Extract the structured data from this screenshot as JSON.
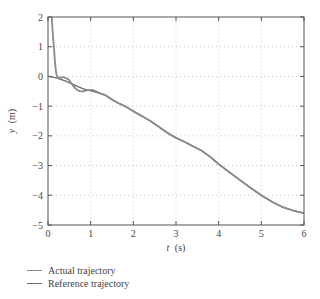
{
  "chart_data": {
    "type": "line",
    "title": "",
    "xlabel": "t (s)",
    "xlabel_var": "t",
    "xlabel_unit": "(s)",
    "ylabel": "y (m)",
    "ylabel_var": "y",
    "ylabel_unit": "(m)",
    "xlim": [
      0,
      6
    ],
    "ylim": [
      -5,
      2
    ],
    "xticks": [
      0,
      1,
      2,
      3,
      4,
      5,
      6
    ],
    "yticks": [
      2,
      1,
      0,
      -1,
      -2,
      -3,
      -4,
      -5
    ],
    "xtick_labels": [
      "0",
      "1",
      "2",
      "3",
      "4",
      "5",
      "6"
    ],
    "ytick_labels": [
      "2",
      "1",
      "0",
      "−1",
      "−2",
      "−3",
      "−4",
      "−5"
    ],
    "grid": true,
    "grid_style": "dotted",
    "legend_position": "below",
    "series": [
      {
        "name": "Actual trajectory",
        "color": "#8a8a8a",
        "x": [
          0.09,
          0.1,
          0.12,
          0.14,
          0.16,
          0.18,
          0.2,
          0.24,
          0.3,
          0.36,
          0.42,
          0.48,
          0.52,
          0.58,
          0.64,
          0.7,
          0.76,
          0.82,
          0.88,
          0.94,
          1.0,
          1.06,
          1.12,
          1.2,
          1.34,
          1.5,
          1.65,
          1.8,
          2.0,
          2.16,
          2.4,
          2.62,
          2.8,
          3.0,
          3.2,
          3.4,
          3.6,
          3.8,
          4.0,
          4.25,
          4.5,
          4.75,
          5.0,
          5.25,
          5.5,
          5.75,
          6.0
        ],
        "y": [
          2.0,
          1.7,
          1.3,
          0.95,
          0.55,
          0.25,
          0.05,
          -0.03,
          -0.05,
          -0.02,
          -0.06,
          -0.1,
          -0.18,
          -0.3,
          -0.4,
          -0.47,
          -0.5,
          -0.5,
          -0.48,
          -0.46,
          -0.45,
          -0.46,
          -0.5,
          -0.55,
          -0.63,
          -0.78,
          -0.9,
          -1.0,
          -1.17,
          -1.3,
          -1.5,
          -1.72,
          -1.9,
          -2.07,
          -2.2,
          -2.35,
          -2.5,
          -2.7,
          -2.95,
          -3.22,
          -3.49,
          -3.75,
          -4.0,
          -4.22,
          -4.4,
          -4.52,
          -4.6
        ]
      },
      {
        "name": "Reference trajectory",
        "color": "#6e6e6e",
        "x": [
          0.0,
          0.2,
          0.4,
          0.6,
          0.8,
          0.95,
          1.1,
          1.34,
          1.5,
          1.65,
          1.8,
          2.0,
          2.16,
          2.4,
          2.62,
          2.8,
          3.0,
          3.2,
          3.4,
          3.6,
          3.8,
          4.0,
          4.25,
          4.5,
          4.75,
          5.0,
          5.25,
          5.5,
          5.75,
          6.0
        ],
        "y": [
          0.0,
          -0.05,
          -0.15,
          -0.28,
          -0.4,
          -0.47,
          -0.52,
          -0.63,
          -0.78,
          -0.9,
          -1.0,
          -1.17,
          -1.3,
          -1.5,
          -1.72,
          -1.9,
          -2.07,
          -2.2,
          -2.35,
          -2.5,
          -2.7,
          -2.95,
          -3.22,
          -3.49,
          -3.75,
          -4.0,
          -4.22,
          -4.4,
          -4.52,
          -4.6
        ]
      }
    ]
  }
}
